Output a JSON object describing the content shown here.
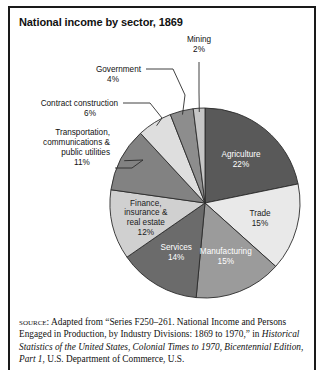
{
  "figure": {
    "title": "National income by sector, 1869",
    "border_color": "#1a1a1a",
    "background": "#ffffff"
  },
  "chart_data": {
    "type": "pie",
    "title": "National income by sector, 1869",
    "xlabel": "",
    "ylabel": "",
    "units": "percent",
    "legend_position": "none",
    "grid": false,
    "start_angle_deg": -90,
    "direction": "clockwise",
    "categories": [
      "Agriculture",
      "Trade",
      "Manufacturing",
      "Services",
      "Finance, insurance & real estate",
      "Transportation, communications & public utilities",
      "Contract construction",
      "Government",
      "Mining"
    ],
    "values": [
      22,
      15,
      15,
      14,
      12,
      11,
      6,
      4,
      2
    ],
    "slices": [
      {
        "name": "Agriculture",
        "value": 22,
        "value_label": "22%",
        "label_lines": [
          "Agriculture",
          "22%"
        ],
        "color": "#595959",
        "label_placement": "inside",
        "label_color": "#ffffff"
      },
      {
        "name": "Trade",
        "value": 15,
        "value_label": "15%",
        "label_lines": [
          "Trade",
          "15%"
        ],
        "color": "#e9e9e9",
        "label_placement": "inside",
        "label_color": "#1b1b1b"
      },
      {
        "name": "Manufacturing",
        "value": 15,
        "value_label": "15%",
        "label_lines": [
          "Manufacturing",
          "15%"
        ],
        "color": "#9b9b9b",
        "label_placement": "inside",
        "label_color": "#ffffff"
      },
      {
        "name": "Services",
        "value": 14,
        "value_label": "14%",
        "label_lines": [
          "Services",
          "14%"
        ],
        "color": "#6b6b6b",
        "label_placement": "inside",
        "label_color": "#ffffff"
      },
      {
        "name": "Finance, insurance & real estate",
        "value": 12,
        "value_label": "12%",
        "label_lines": [
          "Finance,",
          "insurance &",
          "real estate",
          "12%"
        ],
        "color": "#d0d0d0",
        "label_placement": "inside",
        "label_color": "#1b1b1b"
      },
      {
        "name": "Transportation, communications & public utilities",
        "value": 11,
        "value_label": "11%",
        "label_lines": [
          "Transportation,",
          "communications &",
          "public utilities",
          "11%"
        ],
        "color": "#828282",
        "label_placement": "callout",
        "label_color": "#111111"
      },
      {
        "name": "Contract construction",
        "value": 6,
        "value_label": "6%",
        "label_lines": [
          "Contract construction",
          "6%"
        ],
        "color": "#dedede",
        "label_placement": "callout",
        "label_color": "#111111"
      },
      {
        "name": "Government",
        "value": 4,
        "value_label": "4%",
        "label_lines": [
          "Government",
          "4%"
        ],
        "color": "#8d8d8d",
        "label_placement": "callout",
        "label_color": "#111111"
      },
      {
        "name": "Mining",
        "value": 2,
        "value_label": "2%",
        "label_lines": [
          "Mining",
          "2%"
        ],
        "color": "#c6c6c6",
        "label_placement": "callout",
        "label_color": "#111111"
      }
    ]
  },
  "source": {
    "caps_prefix": "source:",
    "line1_rest": " Adapted from “Series F250–261. National Income and",
    "line2": "Persons Engaged in Production, by Industry Divisions: 1869 to 1970,”",
    "line3_plain_start": "in ",
    "line3_italic": "Historical Statistics of the United States, Colonial Times to 1970,",
    "line4_italic": "Bicentennial Edition, Part 1",
    "line4_plain_end": ", U.S. Department of Commerce, U.S."
  }
}
